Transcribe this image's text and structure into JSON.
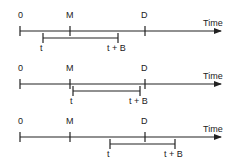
{
  "diagram": {
    "axis_label": "Time",
    "timelines": [
      {
        "labels": {
          "zero": "0",
          "m": "M",
          "d": "D",
          "t": "t",
          "tb": "t + B",
          "time": "Time"
        },
        "y": 31,
        "x": {
          "zero": 20,
          "m": 70,
          "d": 145,
          "t": 43,
          "tb": 118,
          "end": 222
        }
      },
      {
        "labels": {
          "zero": "0",
          "m": "M",
          "d": "D",
          "t": "t",
          "tb": "t + B",
          "time": "Time"
        },
        "y": 84,
        "x": {
          "zero": 20,
          "m": 70,
          "d": 145,
          "t": 73,
          "tb": 140,
          "end": 222
        }
      },
      {
        "labels": {
          "zero": "0",
          "m": "M",
          "d": "D",
          "t": "t",
          "tb": "t + B",
          "time": "Time"
        },
        "y": 137,
        "x": {
          "zero": 20,
          "m": 70,
          "d": 145,
          "t": 110,
          "tb": 175,
          "end": 222
        }
      }
    ]
  }
}
